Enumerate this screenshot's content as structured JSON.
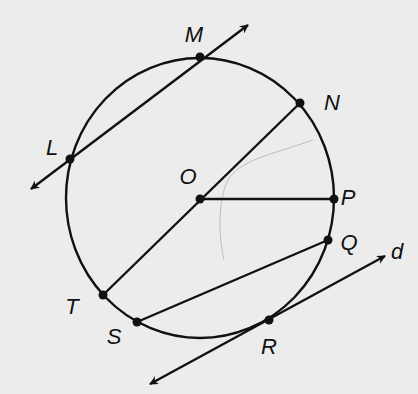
{
  "diagram": {
    "type": "circle-geometry",
    "colors": {
      "background": "#ececec",
      "stroke": "#111111",
      "artifact": "#b8b8b8"
    },
    "circle": {
      "name": "circle O",
      "cx": 200,
      "cy": 198,
      "rx": 134,
      "ry": 140
    },
    "points": [
      {
        "id": "M",
        "label": "M",
        "x": 200,
        "y": 57,
        "lx": 194,
        "ly": 35
      },
      {
        "id": "N",
        "label": "N",
        "x": 300,
        "y": 103,
        "lx": 332,
        "ly": 103
      },
      {
        "id": "L",
        "label": "L",
        "x": 70,
        "y": 159,
        "lx": 52,
        "ly": 148
      },
      {
        "id": "O",
        "label": "O",
        "x": 200,
        "y": 199,
        "lx": 188,
        "ly": 177
      },
      {
        "id": "P",
        "label": "P",
        "x": 334,
        "y": 199,
        "lx": 348,
        "ly": 198
      },
      {
        "id": "Q",
        "label": "Q",
        "x": 328,
        "y": 240,
        "lx": 349,
        "ly": 243
      },
      {
        "id": "T",
        "label": "T",
        "x": 103,
        "y": 295,
        "lx": 72,
        "ly": 307
      },
      {
        "id": "S",
        "label": "S",
        "x": 137,
        "y": 322,
        "lx": 114,
        "ly": 337
      },
      {
        "id": "R",
        "label": "R",
        "x": 269,
        "y": 320,
        "lx": 269,
        "ly": 347
      }
    ],
    "lines": [
      {
        "id": "secant-LM",
        "type": "line",
        "x1": 31,
        "y1": 189,
        "x2": 248,
        "y2": 25
      },
      {
        "id": "tangent-d",
        "type": "line",
        "label": "d",
        "x1": 150,
        "y1": 384,
        "x2": 385,
        "y2": 256,
        "lx": 397,
        "ly": 252
      }
    ],
    "segments": [
      {
        "id": "diameter-NT",
        "x1": 300,
        "y1": 103,
        "x2": 103,
        "y2": 295
      },
      {
        "id": "radius-OP",
        "x1": 200,
        "y1": 199,
        "x2": 334,
        "y2": 199
      },
      {
        "id": "chord-SQ",
        "x1": 137,
        "y1": 322,
        "x2": 328,
        "y2": 240
      }
    ],
    "line_label": "d"
  }
}
